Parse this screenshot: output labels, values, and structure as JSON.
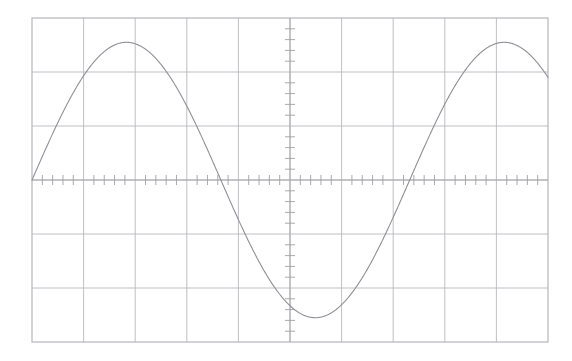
{
  "display": {
    "name": "oscilloscope-graticule-display",
    "background_color": "#ffffff",
    "grid_color": "#b9b9bd",
    "axis_color": "#a9a9ad",
    "tick_color": "#a0a0a6",
    "trace_color": "#8f8f96",
    "border_color": "#b0b0b6",
    "graticule": {
      "left": 32,
      "top": 18,
      "right": 548,
      "bottom": 342,
      "width": 516,
      "height": 324,
      "divisions_x": 10,
      "divisions_y": 6,
      "div_width": 51.6,
      "div_height": 54,
      "subdivisions_per_div": 5,
      "minor_tick_length": 5,
      "center_x": 290,
      "center_y": 180
    }
  },
  "chart_data": {
    "type": "line",
    "title": "",
    "subtitle": "",
    "xlabel": "",
    "ylabel": "",
    "grid": true,
    "legend_position": "none",
    "xlim": [
      -5,
      5
    ],
    "ylim": [
      -3,
      3
    ],
    "x_tick_labels": [],
    "y_tick_labels": [],
    "series": [
      {
        "name": "sine-trace",
        "waveform": "sine",
        "amplitude_div": 2.55,
        "period_div": 7.32,
        "phase_div": 0,
        "offset_div": 0,
        "x": [
          -5.0,
          -4.75,
          -4.5,
          -4.25,
          -4.0,
          -3.75,
          -3.5,
          -3.25,
          -3.0,
          -2.75,
          -2.5,
          -2.25,
          -2.0,
          -1.75,
          -1.5,
          -1.25,
          -1.0,
          -0.75,
          -0.5,
          -0.25,
          0.0,
          0.25,
          0.5,
          0.75,
          1.0,
          1.25,
          1.5,
          1.75,
          2.0,
          2.25,
          2.5,
          2.75,
          3.0,
          3.25,
          3.5,
          3.75,
          4.0,
          4.25,
          4.5,
          4.75,
          5.0
        ],
        "values": [
          0.0,
          0.54,
          1.05,
          1.52,
          1.94,
          2.26,
          2.47,
          2.55,
          2.52,
          2.36,
          2.09,
          1.72,
          1.27,
          0.77,
          0.23,
          -0.32,
          -0.85,
          -1.35,
          -1.79,
          -2.14,
          -2.39,
          -2.53,
          -2.55,
          -2.45,
          -2.23,
          -1.92,
          -1.52,
          -1.06,
          -0.56,
          -0.02,
          0.51,
          1.03,
          1.5,
          1.92,
          2.25,
          2.46,
          2.55,
          2.51,
          2.35,
          2.07,
          1.69
        ]
      }
    ],
    "annotations": [],
    "axis_markers": {
      "horizontal_axis_at_div": 0,
      "vertical_axis_at_div": 0
    }
  }
}
